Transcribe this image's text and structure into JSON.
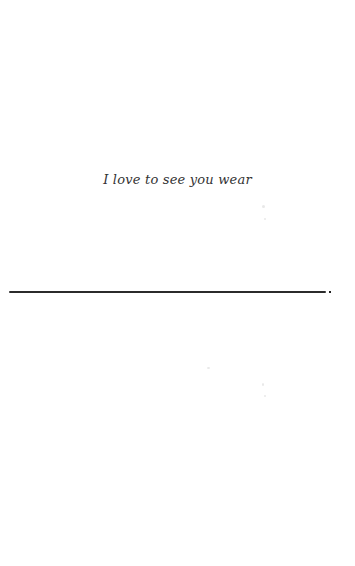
{
  "page": {
    "text_line": "I love to see you wear"
  }
}
